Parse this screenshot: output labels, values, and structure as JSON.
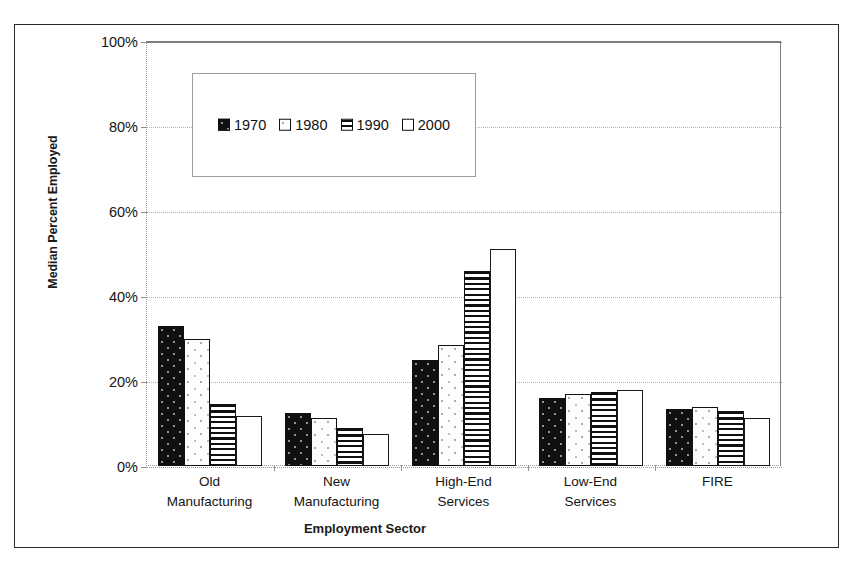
{
  "chart_data": {
    "type": "bar",
    "title": "",
    "xlabel": "Employment Sector",
    "ylabel": "Median Percent Employed",
    "categories": [
      "Old Manufacturing",
      "New Manufacturing",
      "High-End Services",
      "Low-End Services",
      "FIRE"
    ],
    "category_lines": [
      [
        "Old",
        "Manufacturing"
      ],
      [
        "New",
        "Manufacturing"
      ],
      [
        "High-End",
        "Services"
      ],
      [
        "Low-End",
        "Services"
      ],
      [
        "FIRE",
        ""
      ]
    ],
    "series": [
      {
        "name": "1970",
        "pattern": "solid-black-dotted",
        "values": [
          33.0,
          12.5,
          25.0,
          16.0,
          13.5
        ]
      },
      {
        "name": "1980",
        "pattern": "white-dotted",
        "values": [
          30.0,
          11.2,
          28.5,
          17.0,
          14.0
        ]
      },
      {
        "name": "1990",
        "pattern": "horizontal-lines",
        "values": [
          14.7,
          9.0,
          46.0,
          17.3,
          13.0
        ]
      },
      {
        "name": "2000",
        "pattern": "white-empty",
        "values": [
          11.7,
          7.6,
          51.0,
          17.8,
          11.3
        ]
      }
    ],
    "ylim": [
      0,
      100
    ],
    "y_ticks": [
      0,
      20,
      40,
      60,
      80,
      100
    ],
    "y_tick_labels": [
      "0%",
      "20%",
      "40%",
      "60%",
      "80%",
      "100%"
    ],
    "grid": true,
    "legend_position": "inside-upper-left",
    "colors": {
      "axis": "#6f6f6f",
      "gridline": "#b4b4b4",
      "bar_outline": "#111111",
      "series_1970": "#101010",
      "series_1980": "#fdfdfd",
      "series_1990": "#ffffff",
      "series_2000": "#ffffff",
      "text": "#141414"
    }
  }
}
